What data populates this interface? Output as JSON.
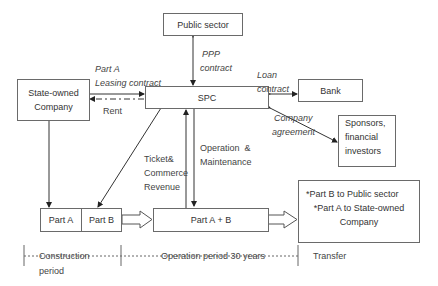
{
  "boxes": {
    "public_sector": "Public sector",
    "spc": "SPC",
    "state_owned": [
      "State-owned",
      "Company"
    ],
    "bank": "Bank",
    "sponsors": [
      "Sponsors,",
      "financial",
      "investors"
    ],
    "part_a": "Part A",
    "part_b": "Part B",
    "part_ab": "Part A + B",
    "transfer_box": [
      "*Part B to Public sector",
      "*Part A to State-owned",
      "Company"
    ]
  },
  "labels": {
    "ppp": [
      "PPP",
      "contract"
    ],
    "leasing": [
      "Part A",
      "Leasing contract"
    ],
    "rent": "Rent",
    "loan": [
      "Loan",
      "contract"
    ],
    "company_agreement": [
      "Company",
      "agreement"
    ],
    "ticket": [
      "Ticket&",
      "Commerce",
      "Revenue"
    ],
    "operation": [
      "Operation  &",
      "Maintenance"
    ]
  },
  "timeline": {
    "construction": [
      "Construction",
      "period"
    ],
    "operation": "Operation period 30 years",
    "transfer": "Transfer"
  },
  "colors": {
    "line": "#333333",
    "box_border": "#6a6a6a",
    "text": "#333333"
  }
}
